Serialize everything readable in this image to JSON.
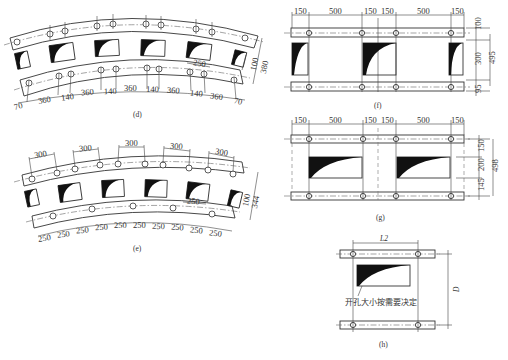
{
  "panels": {
    "d": {
      "caption": "(d)",
      "bottom_dims": [
        "70",
        "360",
        "140",
        "360",
        "140",
        "360",
        "140",
        "360",
        "140",
        "360",
        "70"
      ],
      "inner_dim": "250",
      "right_dims": {
        "small": "100",
        "large": "380"
      }
    },
    "e": {
      "caption": "(e)",
      "top_dims": [
        "300",
        "300",
        "300",
        "300",
        "300"
      ],
      "bottom_dims": [
        "250",
        "250",
        "250",
        "250",
        "250",
        "250",
        "250",
        "250",
        "250",
        "250"
      ],
      "inner_dim": "250",
      "right_dims": {
        "small": "100",
        "large": "344"
      }
    },
    "f": {
      "caption": "(f)",
      "top_dims": [
        "150",
        "500",
        "150",
        "150",
        "500",
        "150"
      ],
      "right_dims": [
        "100",
        "300",
        "95"
      ],
      "overall_dim": "495"
    },
    "g": {
      "caption": "(g)",
      "top_dims": [
        "150",
        "500",
        "150",
        "150",
        "500",
        "150"
      ],
      "right_dims": [
        "150",
        "200",
        "145"
      ],
      "overall_dim": "498"
    },
    "h": {
      "caption": "(h)",
      "width_label": "L2",
      "height_label": "D",
      "note": "开孔大小按需要决定"
    }
  }
}
